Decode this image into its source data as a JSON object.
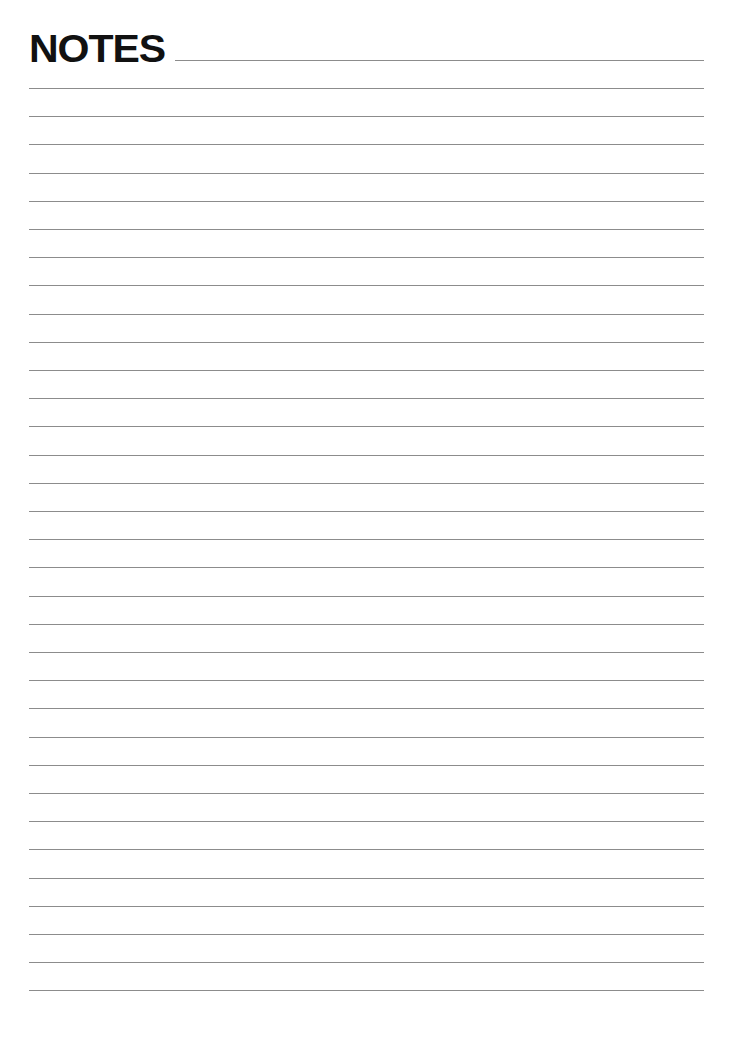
{
  "page": {
    "title": "NOTES",
    "line_color": "#8c8c8c",
    "ruled_line_count": 33
  }
}
